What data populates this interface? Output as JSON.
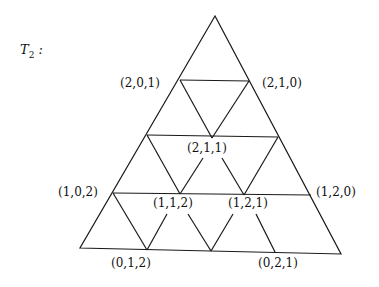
{
  "title": {
    "main": "T",
    "sub": "2",
    "suffix": " :"
  },
  "labels": [
    {
      "text": "(2,0,1)",
      "x": 120,
      "y": 76
    },
    {
      "text": "(2,1,0)",
      "x": 262,
      "y": 76
    },
    {
      "text": "(2,1,1)",
      "x": 187,
      "y": 141
    },
    {
      "text": "(1,0,2)",
      "x": 58,
      "y": 185
    },
    {
      "text": "(1,2,0)",
      "x": 316,
      "y": 185
    },
    {
      "text": "(1,1,2)",
      "x": 153,
      "y": 196
    },
    {
      "text": "(1,2,1)",
      "x": 228,
      "y": 196
    },
    {
      "text": "(0,1,2)",
      "x": 111,
      "y": 256
    },
    {
      "text": "(0,2,1)",
      "x": 258,
      "y": 256
    }
  ],
  "line_color": "#1a1a1a"
}
